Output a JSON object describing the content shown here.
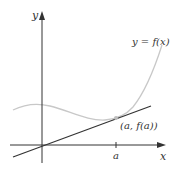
{
  "diagram": {
    "axes": {
      "x_label": "x",
      "y_label": "y",
      "origin": [
        42,
        145
      ],
      "axis_color": "#333333"
    },
    "curve": {
      "label": "y = f(x)",
      "color": "#c8c8c8"
    },
    "tangent_line": {
      "color": "#333333"
    },
    "tangent_point": {
      "label": "(a, f(a))",
      "color": "#bdbdbd"
    },
    "x_tick": {
      "label": "a"
    }
  }
}
